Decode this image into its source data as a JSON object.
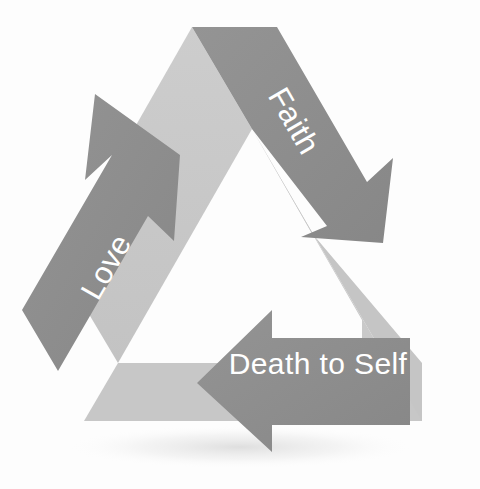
{
  "figure": {
    "kind": "cycle-diagram",
    "style": "recycling-triangle",
    "background_color": "#fdfdfd",
    "shadow_color": "#e6e6e6",
    "arrow_count": 3,
    "rotation_direction": "clockwise"
  },
  "palette": {
    "arrow_dark": "#8d8d8d",
    "arrow_dark_shade": "#868686",
    "ribbon_light": "#c9c9c9",
    "ribbon_light_2": "#c2c2c2",
    "label_color": "#ffffff",
    "background": "#fdfdfd",
    "shadow": "#eaeaea"
  },
  "arrows": [
    {
      "id": "faith",
      "label": "Faith",
      "position": "top-right",
      "direction": "down-right",
      "label_rotation_deg": 60,
      "fill": "#8d8d8d",
      "label_color": "#ffffff"
    },
    {
      "id": "love",
      "label": "Love",
      "position": "left",
      "direction": "up-right",
      "label_rotation_deg": -60,
      "fill": "#8d8d8d",
      "label_color": "#ffffff"
    },
    {
      "id": "death-to-self",
      "label": "Death to Self",
      "position": "bottom",
      "direction": "left",
      "label_rotation_deg": 0,
      "fill": "#8d8d8d",
      "label_color": "#ffffff"
    }
  ],
  "ribbon": {
    "id": "triangle-ribbon",
    "fill": "#c9c9c9",
    "description": "light grey triangular band behind the three arrows"
  }
}
